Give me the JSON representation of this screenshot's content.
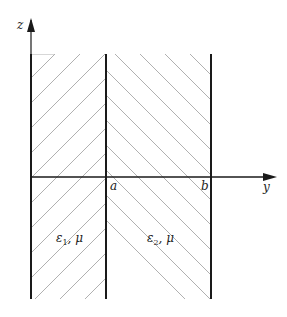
{
  "diagram": {
    "type": "layered-media-cross-section",
    "axes": {
      "vertical": {
        "label": "z"
      },
      "horizontal": {
        "label": "y"
      }
    },
    "interfaces": [
      {
        "label": "",
        "position": "left boundary"
      },
      {
        "label": "a",
        "position": "middle"
      },
      {
        "label": "b",
        "position": "right"
      }
    ],
    "regions": [
      {
        "name": "region-1",
        "eps": "ε",
        "eps_sub": "1",
        "mu": ", μ",
        "hatch": "diagonal-forward"
      },
      {
        "name": "region-2",
        "eps": "ε",
        "eps_sub": "2",
        "mu": ", μ",
        "hatch": "diagonal-backward"
      }
    ],
    "colors": {
      "line": "#1a1a1a",
      "hatch": "#b0b0b0"
    }
  }
}
